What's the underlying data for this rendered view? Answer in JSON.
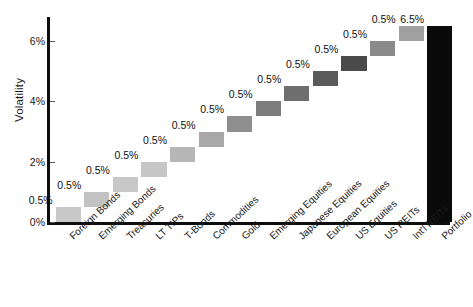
{
  "chart_data": {
    "type": "bar",
    "subtype": "waterfall",
    "title": "",
    "subtitle": "",
    "xlabel": "",
    "ylabel": "Volatility",
    "ylim": [
      0,
      6.8
    ],
    "yticks": [
      0,
      2,
      4,
      6
    ],
    "ytick_labels": [
      "0%",
      "2%",
      "4%",
      "6%"
    ],
    "grid": false,
    "legend": null,
    "value_label_suffix": "%",
    "categories": [
      "Foreign Bonds",
      "Emerging Bonds",
      "Treasuries",
      "LT TIPs",
      "T-Bonds",
      "Commodities",
      "Gold",
      "Emerging Equities",
      "Japanese Equities",
      "European Equities",
      "US Equities",
      "US REITs",
      "Int'l REITs",
      "Portfolio"
    ],
    "values": [
      0.5,
      0.5,
      0.5,
      0.5,
      0.5,
      0.5,
      0.5,
      0.5,
      0.5,
      0.5,
      0.5,
      0.5,
      0.5,
      6.5
    ],
    "value_labels": [
      "0.5%",
      "0.5%",
      "0.5%",
      "0.5%",
      "0.5%",
      "0.5%",
      "0.5%",
      "0.5%",
      "0.5%",
      "0.5%",
      "0.5%",
      "0.5%",
      "0.5%",
      "6.5%"
    ],
    "bar_bases": [
      0.0,
      0.5,
      1.0,
      1.5,
      2.0,
      2.5,
      3.0,
      3.5,
      4.0,
      4.5,
      5.0,
      5.5,
      6.0,
      0.0
    ],
    "bar_tops": [
      0.5,
      1.0,
      1.5,
      2.0,
      2.5,
      3.0,
      3.5,
      4.0,
      4.5,
      5.0,
      5.5,
      6.0,
      6.5,
      6.5
    ],
    "is_total": [
      false,
      false,
      false,
      false,
      false,
      false,
      false,
      false,
      false,
      false,
      false,
      false,
      false,
      true
    ],
    "colors": [
      "#c8c8c8",
      "#c2c2c2",
      "#c8c8c8",
      "#c6c6c6",
      "#b6b6b6",
      "#a8a8a8",
      "#8e8e8e",
      "#7c7c7c",
      "#6e6e6e",
      "#5a5a5a",
      "#4a4a4a",
      "#8a8a8a",
      "#a0a0a0",
      "#0a0a0a"
    ]
  },
  "axis": {
    "y_title": "Volatility",
    "y_tick_labels": [
      "0%",
      "2%",
      "4%",
      "6%"
    ]
  }
}
